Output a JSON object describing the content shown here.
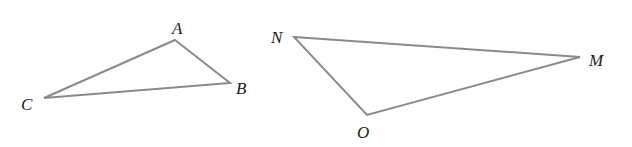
{
  "diagram": {
    "line_color": "#8a8a8a",
    "label_color": "#1a1a1a",
    "triangles": [
      {
        "name": "ABC",
        "vertices": [
          {
            "label": "A",
            "x": 175,
            "y": 40,
            "lx": 172,
            "ly": 34
          },
          {
            "label": "B",
            "x": 230,
            "y": 83,
            "lx": 236,
            "ly": 94
          },
          {
            "label": "C",
            "x": 44,
            "y": 98,
            "lx": 21,
            "ly": 110
          }
        ]
      },
      {
        "name": "NMO",
        "vertices": [
          {
            "label": "N",
            "x": 294,
            "y": 37,
            "lx": 271,
            "ly": 43
          },
          {
            "label": "M",
            "x": 580,
            "y": 57,
            "lx": 589,
            "ly": 66
          },
          {
            "label": "O",
            "x": 367,
            "y": 115,
            "lx": 357,
            "ly": 138
          }
        ]
      }
    ]
  }
}
